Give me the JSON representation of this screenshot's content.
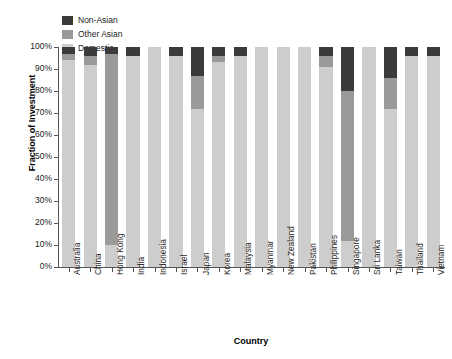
{
  "chart_data": {
    "type": "bar",
    "subtype": "stacked-bar-100-percent",
    "title": "",
    "xlabel": "Country",
    "ylabel": "Fraction of Investment",
    "ylim": [
      0,
      100
    ],
    "yticks": [
      "0%",
      "10%",
      "20%",
      "30%",
      "40%",
      "50%",
      "60%",
      "70%",
      "80%",
      "90%",
      "100%"
    ],
    "grid": false,
    "legend_position": "top-left",
    "legend": [
      "Non-Asian",
      "Other Asian",
      "Domestic"
    ],
    "colors": {
      "Non-Asian": "#3b3b3b",
      "Other Asian": "#9a9a9a",
      "Domestic": "#cdcdcd",
      "axis": "#555555",
      "text": "#222222"
    },
    "categories": [
      "Australia",
      "China",
      "Hong Kong",
      "India",
      "Indonesia",
      "Israel",
      "Japan",
      "Korea",
      "Malaysia",
      "Myanmar",
      "New Zealand",
      "Pakistan",
      "Philippines",
      "Singapore",
      "Sri Lanka",
      "Taiwan",
      "Thailand",
      "Vietnam"
    ],
    "series": [
      {
        "name": "Domestic",
        "values": [
          94,
          92,
          10,
          96,
          100,
          96,
          72,
          93,
          96,
          100,
          100,
          100,
          91,
          12,
          100,
          72,
          96,
          96
        ]
      },
      {
        "name": "Other Asian",
        "values": [
          3,
          4,
          87,
          0,
          0,
          0,
          15,
          3,
          0,
          0,
          0,
          0,
          5,
          68,
          0,
          14,
          0,
          0
        ]
      },
      {
        "name": "Non-Asian",
        "values": [
          3,
          4,
          3,
          4,
          0,
          4,
          13,
          4,
          4,
          0,
          0,
          0,
          4,
          20,
          0,
          14,
          4,
          4
        ]
      }
    ]
  }
}
